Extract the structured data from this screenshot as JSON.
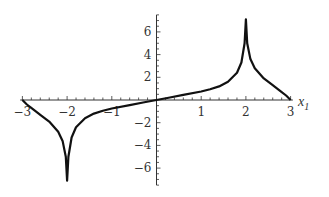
{
  "chart_data": {
    "type": "line",
    "title": "",
    "xlabel": "x",
    "xlabel_subscript": "1",
    "ylabel": "",
    "xlim": [
      -3,
      3
    ],
    "ylim": [
      -7.5,
      7.5
    ],
    "grid": false,
    "legend": null,
    "x_ticks": [
      "-3",
      "-2",
      "-1",
      "1",
      "2",
      "3"
    ],
    "y_ticks": [
      "6",
      "4",
      "2",
      "-2",
      "-4",
      "-6"
    ],
    "series": [
      {
        "name": "curve",
        "color": "#111111",
        "x": [
          -3,
          -2.9,
          -2.8,
          -2.6,
          -2.4,
          -2.2,
          -2.1,
          -2.03,
          -2.0,
          -1.97,
          -1.9,
          -1.8,
          -1.6,
          -1.4,
          -1.2,
          -1.0,
          -0.6,
          -0.3,
          0,
          0.3,
          0.6,
          1.0,
          1.2,
          1.4,
          1.6,
          1.8,
          1.9,
          1.97,
          2.0,
          2.03,
          2.1,
          2.2,
          2.4,
          2.6,
          2.8,
          2.9,
          3.0
        ],
        "y": [
          0,
          -0.4,
          -0.7,
          -1.3,
          -1.9,
          -2.8,
          -3.6,
          -5.0,
          -7.1,
          -5.0,
          -3.3,
          -2.4,
          -1.6,
          -1.2,
          -0.95,
          -0.75,
          -0.45,
          -0.22,
          0,
          0.22,
          0.45,
          0.75,
          0.95,
          1.2,
          1.6,
          2.4,
          3.3,
          5.0,
          7.1,
          5.0,
          3.6,
          2.8,
          1.9,
          1.3,
          0.7,
          0.4,
          0
        ]
      }
    ]
  }
}
